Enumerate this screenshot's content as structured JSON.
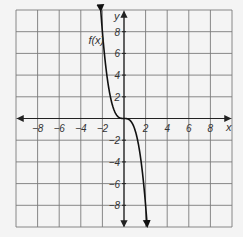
{
  "chart_data": {
    "type": "line",
    "title": "",
    "xlabel": "x",
    "ylabel": "y",
    "xlim": [
      -10,
      10
    ],
    "ylim": [
      -10,
      10
    ],
    "grid": true,
    "grid_step": 2,
    "x_ticks": [
      -8,
      -6,
      -4,
      -2,
      2,
      4,
      6,
      8
    ],
    "x_tick_labels": [
      "−8",
      "−6",
      "−4",
      "−2",
      "2",
      "4",
      "6",
      "8"
    ],
    "y_ticks": [
      8,
      6,
      4,
      2,
      -2,
      -4,
      -6,
      -8
    ],
    "y_tick_labels": [
      "8",
      "6",
      "4",
      "2",
      "−2",
      "−4",
      "−6",
      "−8"
    ],
    "series": [
      {
        "name": "f(x)",
        "label": "f(x)",
        "function": "-x^3",
        "x_domain": [
          -2.15,
          2.15
        ],
        "arrows_at_ends": true,
        "points": [
          [
            -2,
            8
          ],
          [
            -1,
            1
          ],
          [
            0,
            0
          ],
          [
            1,
            -1
          ],
          [
            2,
            -8
          ]
        ]
      }
    ],
    "colors": {
      "grid": "#7a7a7a",
      "axis": "#222222",
      "curve": "#111111",
      "background": "#f4f4f4"
    }
  }
}
